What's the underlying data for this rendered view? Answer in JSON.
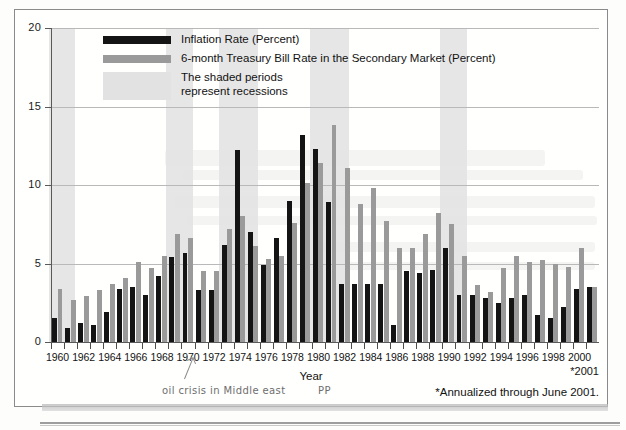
{
  "figure": {
    "axis_title_x": "Year",
    "y_ticks": [
      "0",
      "5",
      "10",
      "15",
      "20"
    ],
    "x_tick_labels": [
      "1960",
      "1962",
      "1964",
      "1966",
      "1968",
      "1970",
      "1972",
      "1974",
      "1976",
      "1978",
      "1980",
      "1982",
      "1984",
      "1986",
      "1988",
      "1990",
      "1992",
      "1994",
      "1996",
      "1998",
      "2000"
    ],
    "star_label": "*2001",
    "footnote": "*Annualized through June 2001.",
    "handwritten_note": "oil crisis in Middle east",
    "handwritten_mark": "PP"
  },
  "legend": {
    "items": [
      {
        "label": "Inflation Rate (Percent)",
        "swatch": "black-bar-swatch",
        "color": "#141414"
      },
      {
        "label": "6-month Treasury Bill Rate in the Secondary Market (Percent)",
        "swatch": "gray-bar-swatch",
        "color": "#9a9a9a"
      },
      {
        "label": "The shaded periods\nrepresent recessions",
        "swatch": "shaded-recession-swatch",
        "color": "#e2e2e2"
      }
    ]
  },
  "chart_data": {
    "type": "bar",
    "title": "",
    "xlabel": "Year",
    "ylabel": "",
    "ylim": [
      0,
      20
    ],
    "yticks": [
      0,
      5,
      10,
      15,
      20
    ],
    "grid": true,
    "legend_position": "top-left-inside",
    "categories": [
      "1960",
      "1961",
      "1962",
      "1963",
      "1964",
      "1965",
      "1966",
      "1967",
      "1968",
      "1969",
      "1970",
      "1971",
      "1972",
      "1973",
      "1974",
      "1975",
      "1976",
      "1977",
      "1978",
      "1979",
      "1980",
      "1981",
      "1982",
      "1983",
      "1984",
      "1985",
      "1986",
      "1987",
      "1988",
      "1989",
      "1990",
      "1991",
      "1992",
      "1993",
      "1994",
      "1995",
      "1996",
      "1997",
      "1998",
      "1999",
      "2000",
      "2001"
    ],
    "series": [
      {
        "name": "Inflation Rate (Percent)",
        "color": "#141414",
        "values": [
          1.5,
          0.9,
          1.2,
          1.1,
          1.9,
          3.4,
          3.5,
          3.0,
          4.2,
          5.4,
          5.7,
          3.3,
          3.3,
          6.2,
          12.2,
          7.0,
          4.9,
          6.6,
          9.0,
          13.2,
          12.3,
          8.9,
          3.7,
          3.7,
          3.7,
          3.7,
          1.1,
          4.5,
          4.4,
          4.6,
          6.0,
          3.0,
          3.0,
          2.8,
          2.5,
          2.8,
          3.0,
          1.7,
          1.5,
          2.2,
          3.4,
          3.5
        ]
      },
      {
        "name": "6-month Treasury Bill Rate in the Secondary Market (Percent)",
        "color": "#9a9a9a",
        "values": [
          3.4,
          2.7,
          2.9,
          3.3,
          3.7,
          4.1,
          5.1,
          4.7,
          5.5,
          6.9,
          6.6,
          4.5,
          4.5,
          7.2,
          8.0,
          6.1,
          5.3,
          5.5,
          7.6,
          10.1,
          11.4,
          13.8,
          11.1,
          8.8,
          9.8,
          7.7,
          6.0,
          6.0,
          6.9,
          8.2,
          7.5,
          5.5,
          3.6,
          3.2,
          4.7,
          5.5,
          5.1,
          5.2,
          5.0,
          4.8,
          6.0,
          3.5
        ]
      }
    ],
    "recession_bands": [
      {
        "start": "1960",
        "end": "1961"
      },
      {
        "start": "1969",
        "end": "1970"
      },
      {
        "start": "1973",
        "end": "1975"
      },
      {
        "start": "1980",
        "end": "1980"
      },
      {
        "start": "1981",
        "end": "1982"
      },
      {
        "start": "1990",
        "end": "1991"
      }
    ]
  }
}
